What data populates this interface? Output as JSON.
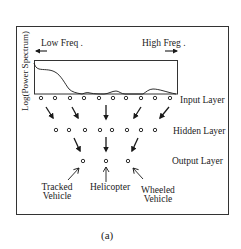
{
  "figure": {
    "caption": "(a)",
    "y_axis_label": "Log(Power Spectrum)",
    "low_freq_label": "Low Freq .",
    "high_freq_label": "High Freg .",
    "layers": {
      "input": {
        "label": "Input Layer",
        "node_count": 10
      },
      "hidden": {
        "label": "Hidden Layer",
        "node_count": 8
      },
      "output": {
        "label": "Output Layer",
        "node_count": 3
      }
    },
    "outputs": [
      {
        "line1": "Tracked",
        "line2": "Vehicle"
      },
      {
        "line1": "Helicopter",
        "line2": ""
      },
      {
        "line1": "Wheeled",
        "line2": "Vehicle"
      }
    ],
    "colors": {
      "stroke": "#1a1a1a",
      "background": "#ffffff"
    }
  }
}
